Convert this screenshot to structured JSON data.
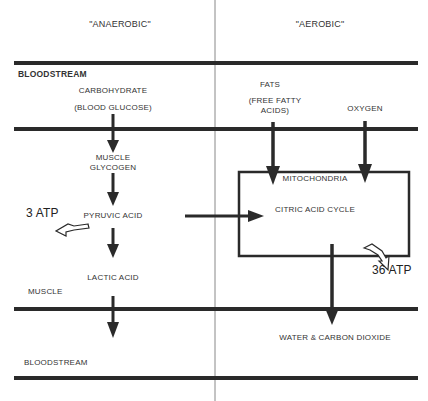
{
  "headers": {
    "anaerobic": "\"ANAEROBIC\"",
    "aerobic": "\"AEROBIC\""
  },
  "compartments": {
    "bloodstream_top": "BLOODSTREAM",
    "muscle": "MUSCLE",
    "bloodstream_bottom": "BLOODSTREAM"
  },
  "anaerobic_path": {
    "carbohydrate": "CARBOHYDRATE",
    "blood_glucose": "(BLOOD GLUCOSE)",
    "muscle_glycogen_1": "MUSCLE",
    "muscle_glycogen_2": "GLYCOGEN",
    "pyruvic_acid": "PYRUVIC ACID",
    "lactic_acid": "LACTIC ACID",
    "atp_yield": "3 ATP"
  },
  "aerobic_path": {
    "fats": "FATS",
    "free_fatty_1": "(FREE FATTY",
    "free_fatty_2": "ACIDS)",
    "oxygen": "OXYGEN",
    "mitochondria": "MITOCHONDRIA",
    "citric_acid_cycle": "CITRIC ACID CYCLE",
    "atp_yield": "36 ATP",
    "products": "WATER & CARBON DIOXIDE"
  },
  "colors": {
    "line": "#2a2a2a",
    "divider": "#888888"
  }
}
